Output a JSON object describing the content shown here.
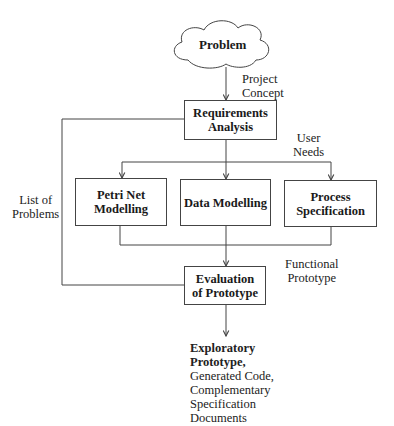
{
  "diagram": {
    "start_node": {
      "label": "Problem"
    },
    "nodes": {
      "requirements": {
        "line1": "Requirements",
        "line2": "Analysis"
      },
      "petri": {
        "line1": "Petri Net",
        "line2": "Modelling"
      },
      "data": {
        "line1": "Data Modelling"
      },
      "process": {
        "line1": "Process",
        "line2": "Specification"
      },
      "evaluation": {
        "line1": "Evaluation",
        "line2": "of Prototype"
      }
    },
    "edge_labels": {
      "project_concept": {
        "line1": "Project",
        "line2": "Concept"
      },
      "user_needs": {
        "line1": "User",
        "line2": "Needs"
      },
      "list_of_problems": {
        "line1": "List of",
        "line2": "Problems"
      },
      "functional_prototype": {
        "line1": "Functional",
        "line2": "Prototype"
      }
    },
    "output": {
      "bold_line1": "Exploratory",
      "bold_line2": "Prototype,",
      "line3": "Generated Code,",
      "line4": "Complementary",
      "line5": "Specification",
      "line6": "Documents"
    },
    "colors": {
      "line": "#444444",
      "text": "#1a1a1a",
      "background": "#ffffff"
    }
  }
}
